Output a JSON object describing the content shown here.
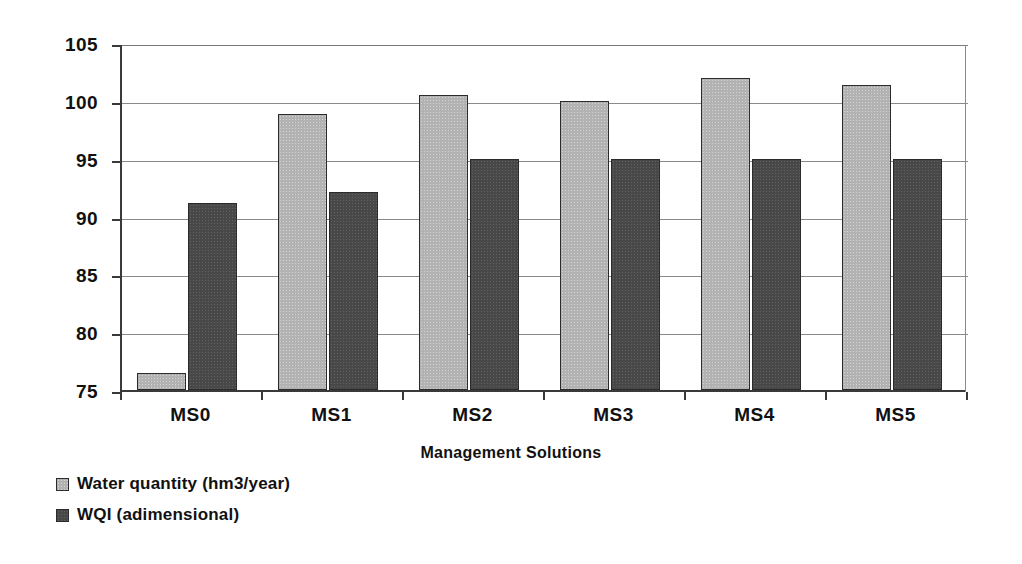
{
  "chart_data": {
    "type": "bar",
    "title": "",
    "xlabel": "Management Solutions",
    "ylabel": "",
    "categories": [
      "MS0",
      "MS1",
      "MS2",
      "MS3",
      "MS4",
      "MS5"
    ],
    "series": [
      {
        "name": "Water quantity (hm3/year)",
        "color": "#b2b2b2",
        "values": [
          76.5,
          98.9,
          100.5,
          100.0,
          102.0,
          101.4
        ]
      },
      {
        "name": "WQI (adimensional)",
        "color": "#484848",
        "values": [
          91.2,
          92.1,
          95.0,
          95.0,
          95.0,
          95.0
        ]
      }
    ],
    "ylim": [
      75,
      105
    ],
    "yticks": [
      75,
      80,
      85,
      90,
      95,
      100,
      105
    ],
    "ytick_labels": [
      "75",
      "80",
      "85",
      "90",
      "95",
      "100",
      "105"
    ],
    "grid": true,
    "legend_position": "below-left",
    "orientation": "vertical",
    "grouped": true
  },
  "legend": {
    "items": [
      {
        "label": "Water quantity (hm3/year)",
        "swatch": "light-gray-swatch"
      },
      {
        "label": "WQI (adimensional)",
        "swatch": "dark-gray-swatch"
      }
    ]
  },
  "axes": {
    "x_title": "Management Solutions"
  }
}
